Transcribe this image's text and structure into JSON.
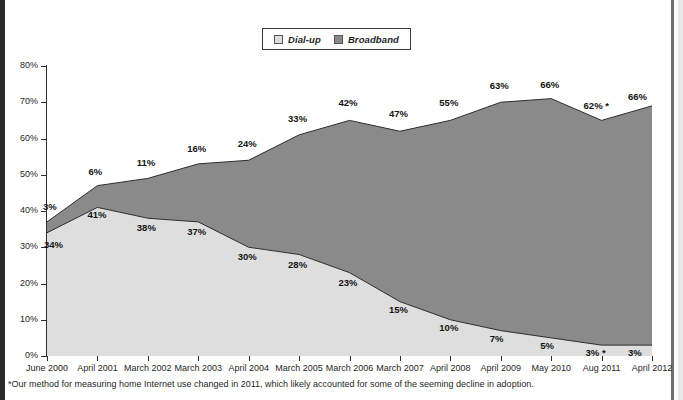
{
  "legend": {
    "items": [
      {
        "label": "Dial-up",
        "color": "#dedede",
        "icon": "legend-swatch-dialup"
      },
      {
        "label": "Broadband",
        "color": "#8a8a8a",
        "icon": "legend-swatch-broadband"
      }
    ]
  },
  "footnote": "*Our method for measuring home Internet use changed in 2011, which likely accounted for some of the seeming decline in adoption.",
  "axes": {
    "y_ticks": [
      "0%",
      "10%",
      "20%",
      "30%",
      "40%",
      "50%",
      "60%",
      "70%",
      "80%"
    ],
    "x_ticks": [
      "June 2000",
      "April 2001",
      "March 2002",
      "March 2003",
      "April 2004",
      "March 2005",
      "March 2006",
      "March 2007",
      "April 2008",
      "April 2009",
      "May 2010",
      "Aug 2011",
      "April 2012"
    ]
  },
  "chart_data": {
    "type": "area",
    "stacked": true,
    "title": "",
    "xlabel": "",
    "ylabel": "",
    "ylim": [
      0,
      80
    ],
    "grid": false,
    "legend_position": "top-center",
    "categories": [
      "June 2000",
      "April 2001",
      "March 2002",
      "March 2003",
      "April 2004",
      "March 2005",
      "March 2006",
      "March 2007",
      "April 2008",
      "April 2009",
      "May 2010",
      "Aug 2011",
      "April 2012"
    ],
    "series": [
      {
        "name": "Dial-up",
        "color": "#dedede",
        "values": [
          34,
          41,
          38,
          37,
          30,
          28,
          23,
          15,
          10,
          7,
          5,
          3,
          3
        ],
        "labels": [
          "34%",
          "41%",
          "38%",
          "37%",
          "30%",
          "28%",
          "23%",
          "15%",
          "10%",
          "7%",
          "5%",
          "3% *",
          "3%"
        ]
      },
      {
        "name": "Broadband",
        "color": "#8a8a8a",
        "values": [
          3,
          6,
          11,
          16,
          24,
          33,
          42,
          47,
          55,
          63,
          66,
          62,
          66
        ],
        "labels": [
          "3%",
          "6%",
          "11%",
          "16%",
          "24%",
          "33%",
          "42%",
          "47%",
          "55%",
          "63%",
          "66%",
          "62% *",
          "66%"
        ]
      }
    ]
  }
}
